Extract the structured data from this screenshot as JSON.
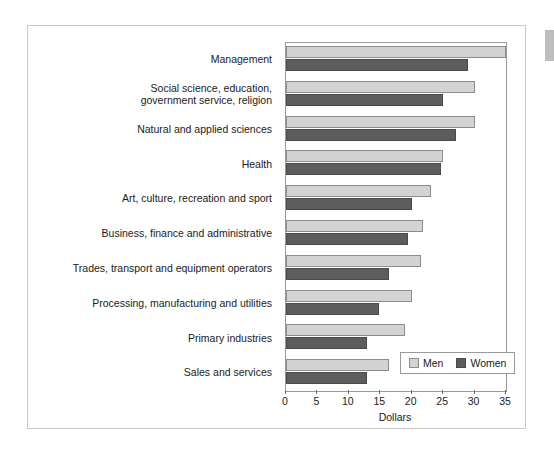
{
  "chart_data": {
    "type": "bar",
    "orientation": "horizontal",
    "title": "",
    "xlabel": "Dollars",
    "ylabel": "",
    "xlim": [
      0,
      35
    ],
    "xticks": [
      0,
      5,
      10,
      15,
      20,
      25,
      30,
      35
    ],
    "grid": false,
    "legend_position": "bottom-right",
    "categories": [
      "Management",
      "Social science, education,\ngovernment service, religion",
      "Natural and applied sciences",
      "Health",
      "Art, culture, recreation and sport",
      "Business, finance and administrative",
      "Trades, transport and equipment operators",
      "Processing, manufacturing and utilities",
      "Primary industries",
      "Sales and services"
    ],
    "series": [
      {
        "name": "Men",
        "color": "#d3d3d3",
        "values": [
          35.0,
          30.0,
          30.0,
          25.0,
          23.0,
          21.8,
          21.5,
          20.0,
          19.0,
          16.4
        ]
      },
      {
        "name": "Women",
        "color": "#5d5d5d",
        "values": [
          29.0,
          25.0,
          27.0,
          24.6,
          20.0,
          19.4,
          16.4,
          14.8,
          12.9,
          12.9
        ]
      }
    ]
  },
  "legend": {
    "men_label": "Men",
    "women_label": "Women"
  },
  "axis": {
    "x_title": "Dollars"
  }
}
